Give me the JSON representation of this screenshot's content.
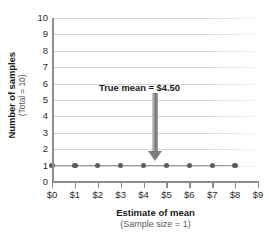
{
  "chart_data": {
    "type": "scatter",
    "title": "",
    "xlabel": "Estimate of mean",
    "xlabel_sub": "(Sample size = 1)",
    "ylabel": "Number of samples",
    "ylabel_sub": "(Total = 10)",
    "x_tick_labels": [
      "$0",
      "$1",
      "$2",
      "$3",
      "$4",
      "$5",
      "$6",
      "$7",
      "$8",
      "$9"
    ],
    "y_tick_labels": [
      "0",
      "1",
      "2",
      "3",
      "4",
      "5",
      "6",
      "7",
      "8",
      "9",
      "10"
    ],
    "xlim": [
      0,
      9
    ],
    "ylim": [
      0,
      10
    ],
    "grid": "horizontal",
    "legend": "none",
    "x": [
      0,
      1,
      2,
      3,
      4,
      5,
      6,
      7,
      8
    ],
    "values": [
      1,
      1,
      1,
      1,
      1,
      1,
      1,
      1,
      1
    ],
    "annotations": [
      {
        "label": "True mean  =  $4.50",
        "x": 4.5,
        "y_from": 5.45,
        "y_to": 1.3,
        "marker": "down-arrow"
      }
    ],
    "colors": {
      "dot": "#5b5b5b",
      "series_line": "#9a9a9a",
      "gridline": "#d7d7d7",
      "axis": "#8d8d8d",
      "arrow": "#7e7e7e",
      "text": "#1a1a1a",
      "text_muted": "#5a5a5a",
      "background": "#ffffff"
    }
  }
}
